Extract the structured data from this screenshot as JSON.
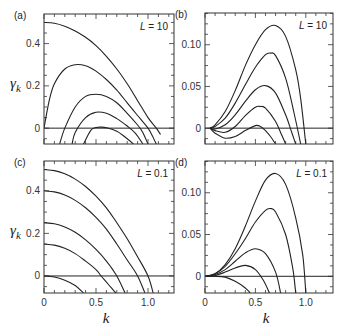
{
  "figure": {
    "xlabel": "k",
    "ylabel": "γ",
    "ylabel_sub": "k"
  },
  "chart_data": [
    {
      "panel": "(a)",
      "type": "line",
      "annotation": "L = 10",
      "xlabel": "k",
      "ylabel": "γ_k",
      "xlim": [
        0,
        1.25
      ],
      "ylim": [
        -0.075,
        0.54
      ],
      "xticks": [
        0,
        0.5,
        1.0
      ],
      "yticks": [
        0,
        0.2,
        0.4
      ],
      "ytick_labels": [
        "0",
        "0.2",
        "0.4"
      ],
      "show_xtick_labels": false,
      "series": [
        {
          "name": "curve1",
          "x": [
            0,
            0.1,
            0.2,
            0.3,
            0.4,
            0.5,
            0.6,
            0.7,
            0.8,
            0.9,
            1.0,
            1.08,
            1.12
          ],
          "y": [
            0.5,
            0.496,
            0.482,
            0.46,
            0.43,
            0.39,
            0.34,
            0.28,
            0.21,
            0.13,
            0.05,
            0.0,
            -0.03
          ]
        },
        {
          "name": "curve2",
          "x": [
            0.0,
            0.05,
            0.1,
            0.2,
            0.3,
            0.4,
            0.5,
            0.6,
            0.7,
            0.8,
            0.9,
            1.0,
            1.04,
            1.08
          ],
          "y": [
            0.0,
            0.13,
            0.21,
            0.28,
            0.3,
            0.295,
            0.27,
            0.23,
            0.18,
            0.12,
            0.06,
            0.0,
            -0.035,
            -0.075
          ]
        },
        {
          "name": "curve3",
          "x": [
            0.15,
            0.2,
            0.3,
            0.4,
            0.5,
            0.6,
            0.7,
            0.8,
            0.9,
            0.95,
            1.0
          ],
          "y": [
            -0.075,
            0.0,
            0.1,
            0.15,
            0.16,
            0.15,
            0.12,
            0.07,
            0.015,
            -0.02,
            -0.075
          ]
        },
        {
          "name": "curve4",
          "x": [
            0.27,
            0.3,
            0.4,
            0.5,
            0.6,
            0.7,
            0.8,
            0.88,
            0.95
          ],
          "y": [
            -0.075,
            -0.02,
            0.05,
            0.075,
            0.07,
            0.045,
            0.01,
            -0.025,
            -0.075
          ]
        },
        {
          "name": "curve5",
          "x": [
            0.38,
            0.45,
            0.5,
            0.55,
            0.6,
            0.7,
            0.8,
            0.86
          ],
          "y": [
            -0.075,
            -0.01,
            0.003,
            0.005,
            0.002,
            -0.015,
            -0.05,
            -0.075
          ]
        }
      ]
    },
    {
      "panel": "(b)",
      "type": "line",
      "annotation": "L = 10",
      "xlabel": "k",
      "ylabel": "",
      "xlim": [
        0,
        1.27
      ],
      "ylim": [
        -0.019,
        0.138
      ],
      "xticks": [
        0,
        0.5,
        1.0
      ],
      "yticks": [
        0,
        0.05,
        0.1
      ],
      "ytick_labels": [
        "0",
        "0.05",
        "0.10"
      ],
      "show_xtick_labels": false,
      "series": [
        {
          "name": "curve1",
          "x": [
            0.05,
            0.1,
            0.2,
            0.3,
            0.4,
            0.5,
            0.6,
            0.7,
            0.8,
            0.9,
            0.95,
            1.0
          ],
          "y": [
            0.0,
            0.004,
            0.02,
            0.045,
            0.075,
            0.1,
            0.118,
            0.123,
            0.11,
            0.07,
            0.035,
            -0.019
          ]
        },
        {
          "name": "curve2",
          "x": [
            0.05,
            0.1,
            0.2,
            0.3,
            0.4,
            0.5,
            0.6,
            0.65,
            0.7,
            0.8,
            0.88,
            0.95
          ],
          "y": [
            0.0,
            0.002,
            0.012,
            0.03,
            0.052,
            0.073,
            0.088,
            0.09,
            0.087,
            0.06,
            0.02,
            -0.019
          ]
        },
        {
          "name": "curve3",
          "x": [
            0.05,
            0.1,
            0.2,
            0.3,
            0.4,
            0.5,
            0.6,
            0.7,
            0.8,
            0.86,
            0.9
          ],
          "y": [
            0.0,
            -0.001,
            0.004,
            0.016,
            0.032,
            0.046,
            0.051,
            0.042,
            0.016,
            -0.005,
            -0.019
          ]
        },
        {
          "name": "curve4",
          "x": [
            0.05,
            0.1,
            0.2,
            0.3,
            0.4,
            0.5,
            0.55,
            0.6,
            0.7,
            0.76,
            0.8
          ],
          "y": [
            0.0,
            -0.003,
            -0.005,
            0.002,
            0.015,
            0.025,
            0.026,
            0.024,
            0.008,
            -0.008,
            -0.019
          ]
        },
        {
          "name": "curve5",
          "x": [
            0.05,
            0.1,
            0.2,
            0.3,
            0.4,
            0.5,
            0.55,
            0.6,
            0.65,
            0.7
          ],
          "y": [
            0.0,
            -0.006,
            -0.012,
            -0.01,
            -0.003,
            0.003,
            0.002,
            -0.003,
            -0.01,
            -0.019
          ]
        }
      ]
    },
    {
      "panel": "(c)",
      "type": "line",
      "annotation": "L = 0.1",
      "xlabel": "k",
      "ylabel": "γ_k",
      "xlim": [
        0,
        1.25
      ],
      "ylim": [
        -0.08,
        0.54
      ],
      "xticks": [
        0,
        0.5,
        1.0
      ],
      "xtick_labels": [
        "0",
        "0.5",
        "1.0"
      ],
      "yticks": [
        0,
        0.2,
        0.4
      ],
      "ytick_labels": [
        "0",
        "0.2",
        "0.4"
      ],
      "series": [
        {
          "name": "curve1",
          "x": [
            0,
            0.1,
            0.2,
            0.3,
            0.4,
            0.5,
            0.6,
            0.7,
            0.8,
            0.9,
            1.0,
            1.05
          ],
          "y": [
            0.5,
            0.495,
            0.48,
            0.455,
            0.42,
            0.375,
            0.32,
            0.25,
            0.175,
            0.09,
            0.0,
            -0.08
          ]
        },
        {
          "name": "curve2",
          "x": [
            0,
            0.1,
            0.2,
            0.3,
            0.4,
            0.5,
            0.6,
            0.7,
            0.8,
            0.9,
            0.97
          ],
          "y": [
            0.4,
            0.395,
            0.38,
            0.355,
            0.32,
            0.275,
            0.22,
            0.15,
            0.075,
            0.0,
            -0.08
          ]
        },
        {
          "name": "curve3",
          "x": [
            0,
            0.1,
            0.2,
            0.3,
            0.4,
            0.5,
            0.6,
            0.7,
            0.78
          ],
          "y": [
            0.25,
            0.245,
            0.23,
            0.205,
            0.17,
            0.125,
            0.07,
            0.0,
            -0.08
          ]
        },
        {
          "name": "curve4",
          "x": [
            0,
            0.1,
            0.2,
            0.3,
            0.4,
            0.5,
            0.55,
            0.62,
            0.69
          ],
          "y": [
            0.15,
            0.145,
            0.13,
            0.105,
            0.07,
            0.03,
            0.0,
            -0.04,
            -0.08
          ]
        },
        {
          "name": "curve5",
          "x": [
            0,
            0.1,
            0.2,
            0.3,
            0.38
          ],
          "y": [
            0.0,
            -0.005,
            -0.02,
            -0.045,
            -0.08
          ]
        }
      ]
    },
    {
      "panel": "(d)",
      "type": "line",
      "annotation": "L = 0.1",
      "xlabel": "k",
      "ylabel": "",
      "xlim": [
        0,
        1.27
      ],
      "ylim": [
        -0.02,
        0.138
      ],
      "xticks": [
        0,
        0.5,
        1.0
      ],
      "xtick_labels": [
        "0",
        "0.5",
        "1.0"
      ],
      "yticks": [
        0,
        0.05,
        0.1
      ],
      "ytick_labels": [
        "0",
        "0.05",
        "0.10"
      ],
      "series": [
        {
          "name": "curve1",
          "x": [
            0.0,
            0.1,
            0.2,
            0.3,
            0.4,
            0.5,
            0.6,
            0.7,
            0.8,
            0.9,
            0.97,
            1.0
          ],
          "y": [
            0.0,
            0.003,
            0.014,
            0.033,
            0.06,
            0.09,
            0.115,
            0.123,
            0.11,
            0.07,
            0.025,
            -0.02
          ]
        },
        {
          "name": "curve2",
          "x": [
            0.0,
            0.1,
            0.2,
            0.3,
            0.4,
            0.5,
            0.6,
            0.65,
            0.7,
            0.8,
            0.87,
            0.9
          ],
          "y": [
            0.0,
            0.003,
            0.012,
            0.027,
            0.045,
            0.065,
            0.079,
            0.081,
            0.077,
            0.05,
            0.01,
            -0.02
          ]
        },
        {
          "name": "curve3",
          "x": [
            0.0,
            0.1,
            0.2,
            0.3,
            0.4,
            0.5,
            0.6,
            0.7,
            0.75
          ],
          "y": [
            0.0,
            0.002,
            0.008,
            0.018,
            0.028,
            0.033,
            0.027,
            0.005,
            -0.02
          ]
        },
        {
          "name": "curve4",
          "x": [
            0.0,
            0.1,
            0.2,
            0.3,
            0.4,
            0.5,
            0.58,
            0.64
          ],
          "y": [
            0.0,
            0.001,
            0.005,
            0.01,
            0.013,
            0.008,
            -0.005,
            -0.02
          ]
        },
        {
          "name": "curve5",
          "x": [
            0.0,
            0.1,
            0.2,
            0.3,
            0.4,
            0.45
          ],
          "y": [
            0.0,
            0.0,
            -0.001,
            -0.006,
            -0.014,
            -0.02
          ]
        }
      ]
    }
  ]
}
